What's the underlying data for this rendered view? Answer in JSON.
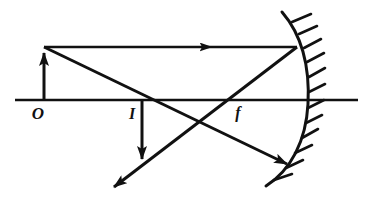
{
  "diagram": {
    "background_color": "#ffffff",
    "stroke_color": "#111111",
    "width": 375,
    "height": 211,
    "labels": {
      "object_point": "O",
      "image_point": "I",
      "focal_point": "f"
    },
    "label_positions": {
      "object_point": {
        "x": 38,
        "y": 117
      },
      "image_point": {
        "x": 132,
        "y": 117
      },
      "focal_point": {
        "x": 236,
        "y": 117
      }
    },
    "principal_axis": {
      "name": "principal-axis",
      "x1": 15,
      "y1": 100,
      "x2": 358,
      "y2": 100,
      "stroke_width": 2.4
    },
    "object_arrow": {
      "name": "object-arrow",
      "x": 44,
      "base_y": 100,
      "tip_y": 47,
      "direction": "up",
      "stroke_width": 3
    },
    "image_arrow": {
      "name": "image-arrow",
      "x": 142,
      "base_y": 100,
      "tip_y": 166,
      "direction": "down",
      "stroke_width": 3
    },
    "rays": [
      {
        "name": "parallel-incident-ray",
        "description": "Ray from object tip parallel to principal axis to mirror",
        "x1": 44,
        "y1": 47,
        "x2": 297,
        "y2": 47,
        "arrow_at": {
          "x": 205,
          "y": 47,
          "angle": 0
        },
        "stroke_width": 2.6
      },
      {
        "name": "reflected-ray-through-focus",
        "description": "Reflected ray from mirror through focal point f continuing down-left",
        "x1": 297,
        "y1": 47,
        "x2": 110,
        "y2": 190,
        "arrow_at": {
          "x": 110,
          "y": 190,
          "angle": 142.6
        },
        "stroke_width": 3
      },
      {
        "name": "ray-through-image-point",
        "description": "Ray from object tip through image point I continuing to mirror lower edge",
        "x1": 44,
        "y1": 47,
        "x2": 292,
        "y2": 167,
        "arrow_at": {
          "x": 292,
          "y": 167,
          "angle": 25.8
        },
        "stroke_width": 3
      }
    ],
    "mirror": {
      "name": "concave-mirror",
      "type": "concave",
      "vertex": {
        "x": 305,
        "y": 100
      },
      "top_end": {
        "x": 282,
        "y": 12
      },
      "bottom_end": {
        "x": 266,
        "y": 186
      },
      "hatch_side": "right",
      "hatch_count": 11,
      "stroke_width": 3
    }
  }
}
